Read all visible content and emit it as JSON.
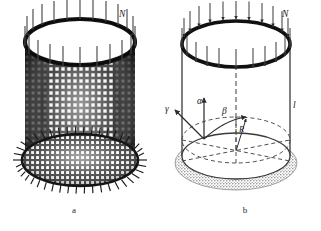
{
  "figure": {
    "panels": [
      {
        "id": "a",
        "caption": "a",
        "description": "woven cylindrical mesh cage with distributed axial load",
        "labels": {
          "load": "N"
        }
      },
      {
        "id": "b",
        "caption": "b",
        "description": "geometric schematic of the cylinder with angular parameters",
        "labels": {
          "load": "N",
          "length": "l",
          "gamma": "γ",
          "alpha": "α",
          "beta": "β",
          "radius": "R"
        }
      }
    ],
    "colors": {
      "ink": "#1c1c1c",
      "mesh_dark": "#262626",
      "shadow_gray": "#9a9a9a",
      "paper": "#ffffff",
      "arrow": "#3a3a3a"
    }
  }
}
